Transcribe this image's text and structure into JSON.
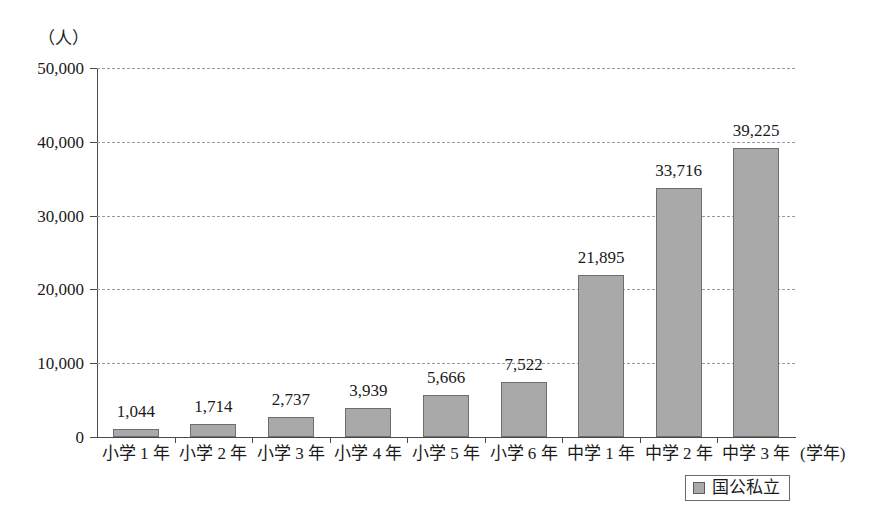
{
  "chart_data": {
    "type": "bar",
    "title": "",
    "xlabel": "(学年)",
    "ylabel": "（人）",
    "ylim": [
      0,
      50000
    ],
    "ytick_labels": [
      "0",
      "10,000",
      "20,000",
      "30,000",
      "40,000",
      "50,000"
    ],
    "ytick_values": [
      0,
      10000,
      20000,
      30000,
      40000,
      50000
    ],
    "grid": true,
    "legend_position": "bottom-right",
    "categories": [
      "小学 1 年",
      "小学 2 年",
      "小学 3 年",
      "小学 4 年",
      "小学 5 年",
      "小学 6 年",
      "中学 1 年",
      "中学 2 年",
      "中学 3 年"
    ],
    "values": [
      1044,
      1714,
      2737,
      3939,
      5666,
      7522,
      21895,
      33716,
      39225
    ],
    "value_labels": [
      "1,044",
      "1,714",
      "2,737",
      "3,939",
      "5,666",
      "7,522",
      "21,895",
      "33,716",
      "39,225"
    ],
    "series": [
      {
        "name": "国公私立",
        "color": "#a9a9a9",
        "values": [
          1044,
          1714,
          2737,
          3939,
          5666,
          7522,
          21895,
          33716,
          39225
        ]
      }
    ],
    "legend": [
      {
        "label": "国公私立",
        "color": "#a9a9a9"
      }
    ]
  },
  "colors": {
    "bar_fill": "#a9a9a9",
    "bar_border": "#6e6e6e",
    "axis": "#4a4a4a",
    "gridline": "#9a9a9a",
    "text": "#1a1a1a",
    "background": "#ffffff"
  }
}
